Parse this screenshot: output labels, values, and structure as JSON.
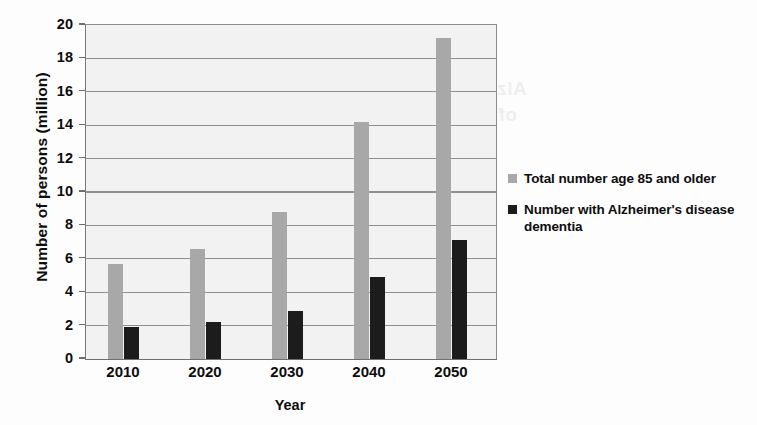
{
  "chart_data": {
    "type": "bar",
    "title": "",
    "xlabel": "Year",
    "ylabel": "Number of persons (million)",
    "categories": [
      "2010",
      "2020",
      "2030",
      "2040",
      "2050"
    ],
    "series": [
      {
        "name": "Total number age 85 and older",
        "color": "#a8a8a8",
        "values": [
          5.7,
          6.6,
          8.8,
          14.2,
          19.2
        ]
      },
      {
        "name": "Number with Alzheimer's disease dementia",
        "color": "#1c1c1c",
        "values": [
          1.9,
          2.2,
          2.9,
          4.9,
          7.1
        ]
      }
    ],
    "ylim": [
      0,
      20
    ],
    "ytick_step": 2,
    "yticks": [
      "20",
      "18",
      "16",
      "14",
      "12",
      "10",
      "8",
      "6",
      "4",
      "2",
      "0"
    ],
    "grid": "horizontal",
    "legend_position": "right"
  },
  "legend": {
    "items": [
      {
        "label": "Total number age 85 and older",
        "swatch": "total"
      },
      {
        "label": "Number with Alzheimer's disease dementia",
        "swatch": "alz"
      }
    ]
  },
  "bleed_text": [
    "Alzheimer's and the sense of timing loss",
    "of diagnosis and risk of dementia among",
    "persons with memory symptoms"
  ],
  "colors": {
    "series_total": "#a8a8a8",
    "series_alzheimers": "#1c1c1c",
    "plot_background": "#f2f2f2",
    "gridline": "#8f8f8f",
    "text": "#0d0d0d"
  }
}
